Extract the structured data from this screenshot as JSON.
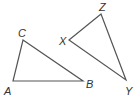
{
  "diagram": {
    "colors": {
      "stroke": "#555555",
      "label": "#333333"
    },
    "triangles": [
      {
        "name": "ABC",
        "vertices": [
          {
            "label": "A",
            "x": 13,
            "y": 81
          },
          {
            "label": "B",
            "x": 83,
            "y": 81
          },
          {
            "label": "C",
            "x": 23,
            "y": 40
          }
        ]
      },
      {
        "name": "XYZ",
        "vertices": [
          {
            "label": "X",
            "x": 69,
            "y": 40
          },
          {
            "label": "Y",
            "x": 126,
            "y": 80
          },
          {
            "label": "Z",
            "x": 101,
            "y": 14
          }
        ]
      }
    ],
    "labels": {
      "A": "A",
      "B": "B",
      "C": "C",
      "X": "X",
      "Y": "Y",
      "Z": "Z"
    }
  }
}
